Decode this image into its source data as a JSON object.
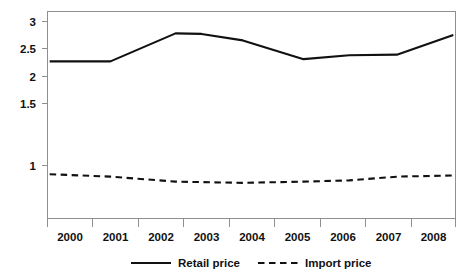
{
  "chart_data": {
    "type": "line",
    "title": "",
    "subtitle": "",
    "xlabel": "",
    "ylabel": "",
    "grid": false,
    "legend_position": "bottom",
    "x": [
      2000,
      2001,
      2002,
      2003,
      2004,
      2005,
      2006,
      2007,
      2008
    ],
    "categories": [
      "2000",
      "2001",
      "2002",
      "2003",
      "2004",
      "2005",
      "2006",
      "2007",
      "2008"
    ],
    "xlim": [
      1999.5,
      2008.9
    ],
    "ylim": [
      0.62,
      3.08
    ],
    "ytick_labels": [
      "3",
      "2.5",
      "2",
      "1.5",
      "1"
    ],
    "ytick_values": [
      3,
      2.5,
      2,
      1.5,
      1
    ],
    "series": [
      {
        "name": "Retail price",
        "style": "solid",
        "color": "#111111",
        "x": [
          1999.55,
          2000.95,
          2002.45,
          2003.05,
          2004.0,
          2005.4,
          2006.45,
          2007.55,
          2008.85
        ],
        "values": [
          2.27,
          2.27,
          2.78,
          2.77,
          2.65,
          2.31,
          2.38,
          2.39,
          2.75
        ]
      },
      {
        "name": "Import price",
        "style": "dashed",
        "color": "#111111",
        "x": [
          1999.55,
          2000.95,
          2002.45,
          2004.0,
          2005.4,
          2006.45,
          2007.55,
          2008.85
        ],
        "values": [
          0.93,
          0.91,
          0.87,
          0.86,
          0.87,
          0.88,
          0.91,
          0.92
        ]
      }
    ]
  },
  "legend": {
    "entries": [
      {
        "label": "Retail price",
        "style": "solid"
      },
      {
        "label": "Import price",
        "style": "dashed"
      }
    ]
  },
  "axes": {
    "y_ticks": [
      {
        "label": "3",
        "value": 3
      },
      {
        "label": "2.5",
        "value": 2.5
      },
      {
        "label": "2",
        "value": 2
      },
      {
        "label": "1.5",
        "value": 1.5
      },
      {
        "label": "1",
        "value": 1
      }
    ],
    "x_ticks": [
      {
        "label": "2000"
      },
      {
        "label": "2001"
      },
      {
        "label": "2002"
      },
      {
        "label": "2003"
      },
      {
        "label": "2004"
      },
      {
        "label": "2005"
      },
      {
        "label": "2006"
      },
      {
        "label": "2007"
      },
      {
        "label": "2008"
      }
    ]
  }
}
